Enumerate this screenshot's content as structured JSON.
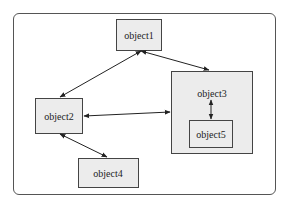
{
  "diagram": {
    "nodes": [
      {
        "id": "object1",
        "label": "object1"
      },
      {
        "id": "object2",
        "label": "object2"
      },
      {
        "id": "object3",
        "label": "object3"
      },
      {
        "id": "object4",
        "label": "object4"
      },
      {
        "id": "object5",
        "label": "object5"
      }
    ],
    "edges": [
      {
        "from": "object1",
        "to": "object2",
        "type": "bidirectional"
      },
      {
        "from": "object1",
        "to": "object3",
        "type": "bidirectional"
      },
      {
        "from": "object2",
        "to": "object3",
        "type": "bidirectional"
      },
      {
        "from": "object2",
        "to": "object4",
        "type": "bidirectional"
      },
      {
        "from": "object3",
        "to": "object5",
        "type": "bidirectional"
      }
    ],
    "containment": [
      {
        "parent": "object3",
        "child": "object5"
      }
    ]
  }
}
